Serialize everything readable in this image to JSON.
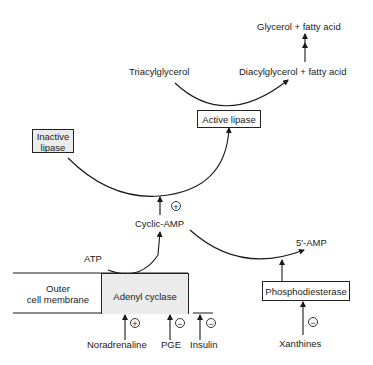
{
  "diagram": {
    "type": "metabolic-regulation-pathway",
    "nodes": {
      "glycerol_fatty_acid": "Glycerol + fatty acid",
      "triacylglycerol": "Triacylglycerol",
      "diacylglycerol_fatty_acid": "Diacylglycerol + fatty acid",
      "active_lipase": "Active lipase",
      "inactive_lipase_line1": "Inactive",
      "inactive_lipase_line2": "lipase",
      "cyclic_amp": "Cyclic-AMP",
      "five_amp": "5'-AMP",
      "atp": "ATP",
      "outer_membrane_line1": "Outer",
      "outer_membrane_line2": "cell membrane",
      "adenyl_cyclase": "Adenyl cyclase",
      "phosphodiesterase": "Phosphodiesterase",
      "noradrenaline": "Noradrenaline",
      "pge": "PGE",
      "insulin": "Insulin",
      "xanthines": "Xanthines"
    },
    "signs": {
      "camp_activation": "+",
      "noradrenaline": "+",
      "pge": "−",
      "insulin": "−",
      "xanthines": "−"
    },
    "edges": [
      {
        "from": "Triacylglycerol",
        "to": "Diacylglycerol + fatty acid",
        "via": "Active lipase"
      },
      {
        "from": "Diacylglycerol + fatty acid",
        "to": "Glycerol + fatty acid"
      },
      {
        "from": "Inactive lipase",
        "to": "Active lipase",
        "effector": "Cyclic-AMP",
        "sign": "+"
      },
      {
        "from": "ATP",
        "to": "Cyclic-AMP",
        "via": "Adenyl cyclase"
      },
      {
        "from": "Cyclic-AMP",
        "to": "5'-AMP",
        "via": "Phosphodiesterase"
      },
      {
        "from": "Noradrenaline",
        "to": "Adenyl cyclase",
        "sign": "+"
      },
      {
        "from": "PGE",
        "to": "Adenyl cyclase",
        "sign": "-"
      },
      {
        "from": "Insulin",
        "to": "Adenyl cyclase",
        "sign": "-"
      },
      {
        "from": "Xanthines",
        "to": "Phosphodiesterase",
        "sign": "-"
      }
    ],
    "colors": {
      "ink": "#1a1a1a",
      "shaded_fill": "#ebebeb",
      "background": "#ffffff"
    }
  }
}
